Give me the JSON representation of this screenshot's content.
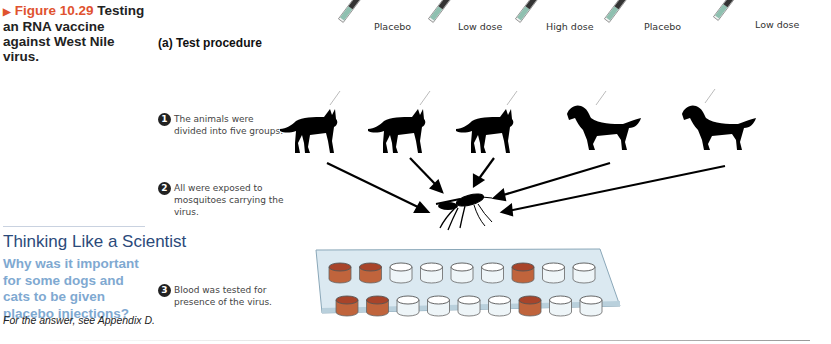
{
  "figure": {
    "label": "Figure 10.29",
    "title": "Testing an RNA vaccine against West Nile virus.",
    "accent_color": "#e0522f"
  },
  "thinking": {
    "title": "Thinking Like a Scientist",
    "question": "Why was it important for some dogs and cats to be given placebo injections?",
    "answer_note": "For the answer, see Appendix D.",
    "title_color": "#2b4a7a",
    "question_color": "#7fa9d1"
  },
  "panel": {
    "title": "(a) Test procedure"
  },
  "steps": [
    {
      "num": "1",
      "text": "The animals were divided into five groups."
    },
    {
      "num": "2",
      "text": "All were exposed to mosquitoes carrying the virus."
    },
    {
      "num": "3",
      "text": "Blood was tested for presence of the virus."
    }
  ],
  "groups": [
    {
      "animal": "cat",
      "dose": "Placebo"
    },
    {
      "animal": "cat",
      "dose": "Low dose"
    },
    {
      "animal": "cat",
      "dose": "High dose"
    },
    {
      "animal": "dog",
      "dose": "Placebo"
    },
    {
      "animal": "dog",
      "dose": "Low dose"
    }
  ],
  "icons": {
    "syringe": "syringe-icon",
    "cat": "cat-silhouette-icon",
    "dog": "dog-silhouette-icon",
    "mosquito": "mosquito-icon",
    "plate": "well-plate-icon"
  },
  "plate": {
    "rows": 2,
    "cols": 9,
    "filled_wells": [
      [
        1,
        2,
        7
      ],
      [
        1,
        2,
        7
      ]
    ],
    "fill_color": "#c0643c"
  }
}
